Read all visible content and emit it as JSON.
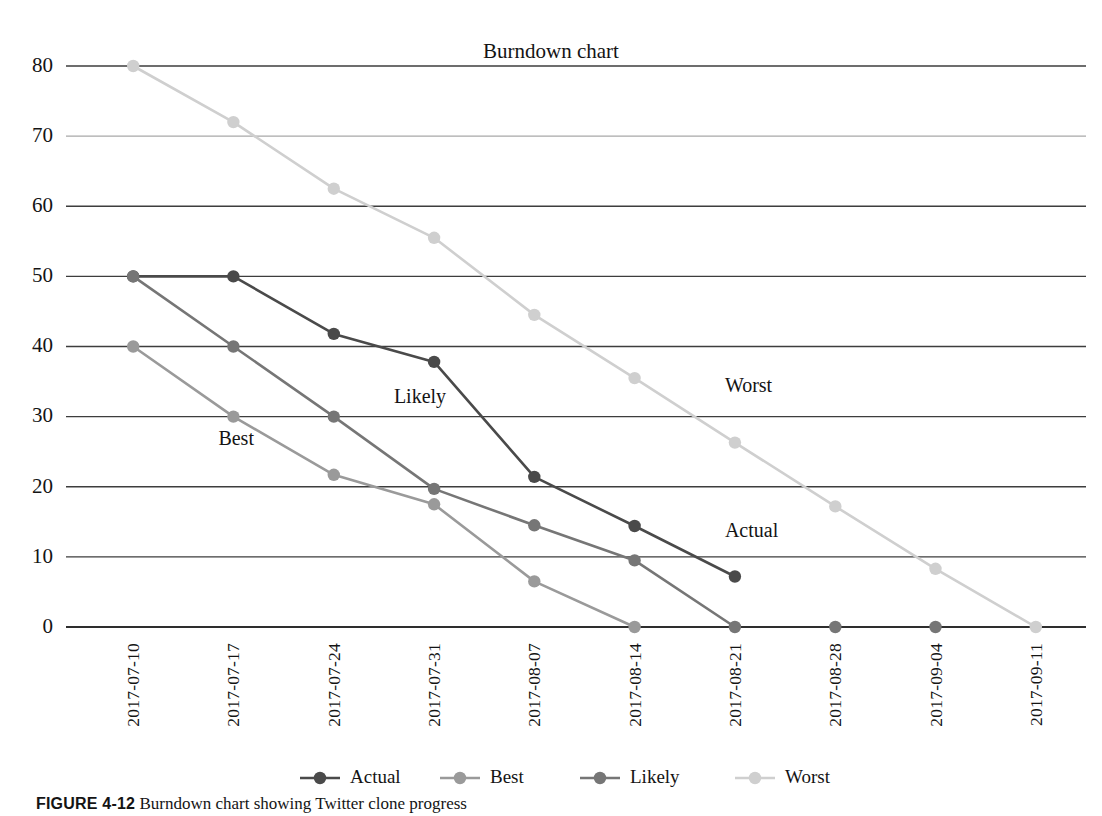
{
  "figure": {
    "caption_prefix": "FIGURE 4-12",
    "caption_text": "Burndown chart showing Twitter clone progress"
  },
  "chart_data": {
    "type": "line",
    "title": "Burndown chart",
    "xlabel": "",
    "ylabel": "",
    "ylim": [
      0,
      80
    ],
    "yticks": [
      0,
      10,
      20,
      30,
      40,
      50,
      60,
      70,
      80
    ],
    "ytick_labels": [
      "0",
      "10",
      "20",
      "30",
      "40",
      "50",
      "60",
      "70",
      "80"
    ],
    "grid": true,
    "legend_position": "bottom",
    "categories": [
      "2017-07-10",
      "2017-07-17",
      "2017-07-24",
      "2017-07-31",
      "2017-08-07",
      "2017-08-14",
      "2017-08-21",
      "2017-08-28",
      "2017-09-04",
      "2017-09-11"
    ],
    "series": [
      {
        "name": "Actual",
        "color": "#4a4a4a",
        "values": [
          50,
          50,
          41.8,
          37.8,
          21.4,
          14.4,
          7.2,
          null,
          null,
          null
        ]
      },
      {
        "name": "Best",
        "color": "#9a9a9a",
        "values": [
          40,
          30,
          21.7,
          17.5,
          6.5,
          0,
          null,
          null,
          null,
          null
        ]
      },
      {
        "name": "Likely",
        "color": "#767676",
        "values": [
          50,
          40,
          30,
          19.7,
          14.5,
          9.5,
          0,
          null,
          null,
          null
        ]
      },
      {
        "name": "Worst",
        "color": "#cfcfcf",
        "values": [
          80,
          72,
          62.5,
          55.5,
          44.5,
          35.5,
          26.3,
          17.2,
          8.3,
          0
        ]
      }
    ],
    "zero_markers": [
      {
        "category": "2017-08-28",
        "color": "#767676"
      },
      {
        "category": "2017-09-04",
        "color": "#767676"
      }
    ],
    "annotations": [
      {
        "label": "Best",
        "x_frac": 0.135,
        "value": 26.0
      },
      {
        "label": "Likely",
        "x_frac": 0.31,
        "value": 32.0
      },
      {
        "label": "Worst",
        "x_frac": 0.64,
        "value": 33.5
      },
      {
        "label": "Actual",
        "x_frac": 0.64,
        "value": 12.8
      }
    ],
    "legend": [
      {
        "label": "Actual",
        "color": "#4a4a4a"
      },
      {
        "label": "Best",
        "color": "#9a9a9a"
      },
      {
        "label": "Likely",
        "color": "#767676"
      },
      {
        "label": "Worst",
        "color": "#cfcfcf"
      }
    ]
  }
}
